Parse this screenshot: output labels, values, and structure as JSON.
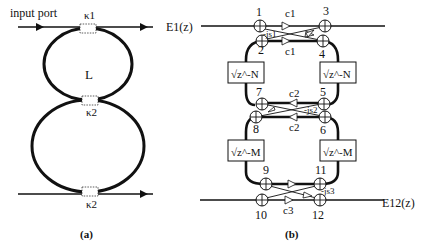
{
  "panel_a": {
    "caption": "(a)",
    "input_label": "input port",
    "ring_label": "L",
    "couplers": [
      {
        "id": "top",
        "label": "κ1"
      },
      {
        "id": "middle",
        "label": "κ2"
      },
      {
        "id": "bottom",
        "label": "κ2"
      }
    ]
  },
  "panel_b": {
    "caption": "(b)",
    "input_label": "E1(z)",
    "output_label": "E12(z)",
    "nodes": [
      "1",
      "2",
      "3",
      "4",
      "5",
      "6",
      "7",
      "8",
      "9",
      "10",
      "11",
      "12"
    ],
    "coefficients": {
      "c1_top": "c1",
      "c1_bottom": "c1",
      "s1": "-js1",
      "c2_top": "c2",
      "c2_bottom": "c2",
      "s2": "-js2",
      "c3": "c3",
      "s3": "-js3"
    },
    "delays": {
      "upper_left": "√z^-N",
      "upper_right": "√z^-N",
      "lower_left": "√z^-M",
      "lower_right": "√z^-M"
    }
  }
}
